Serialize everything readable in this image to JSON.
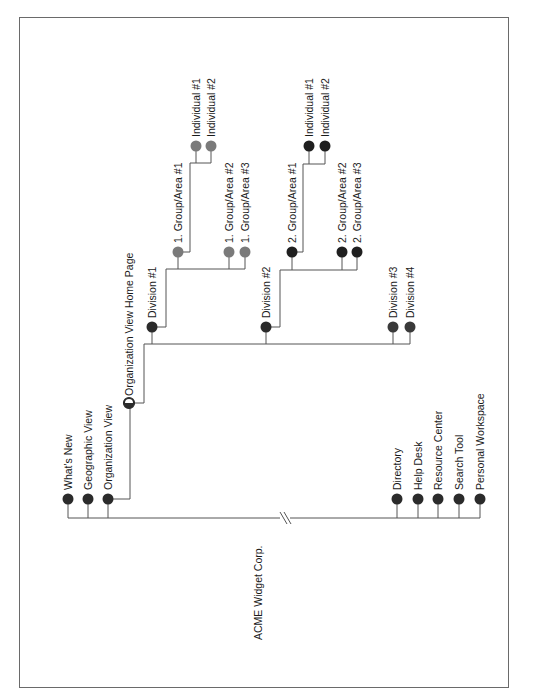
{
  "diagram": {
    "title": "ACME Widget Corp.",
    "colors": {
      "dark_node": "#2b2b2b",
      "gray_node": "#7a7a7a",
      "line": "#555555",
      "border": "#6a6a6a"
    },
    "root_items_left": [
      {
        "label": "What's New",
        "x": 68
      },
      {
        "label": "Geographic View",
        "x": 88
      },
      {
        "label": "Organization View",
        "x": 108
      }
    ],
    "root_items_right": [
      {
        "label": "Directory",
        "x": 397
      },
      {
        "label": "Help Desk",
        "x": 418
      },
      {
        "label": "Resource Center",
        "x": 438
      },
      {
        "label": "Search Tool",
        "x": 459
      },
      {
        "label": "Personal Workspace",
        "x": 480
      }
    ],
    "org_home": {
      "label": "Organization View Home Page"
    },
    "divisions": [
      {
        "label": "Division #1"
      },
      {
        "label": "Division #2"
      },
      {
        "label": "Division #3"
      },
      {
        "label": "Division #4"
      }
    ],
    "division1_groups": [
      {
        "label": "1. Group/Area #1"
      },
      {
        "label": "1. Group/Area #2"
      },
      {
        "label": "1. Group/Area #3"
      }
    ],
    "division1_individuals": [
      {
        "label": "Individual #1"
      },
      {
        "label": "Individual #2"
      }
    ],
    "division2_groups": [
      {
        "label": "2. Group/Area #1"
      },
      {
        "label": "2. Group/Area #2"
      },
      {
        "label": "2. Group/Area #3"
      }
    ],
    "division2_individuals": [
      {
        "label": "Individual #1"
      },
      {
        "label": "Individual #2"
      }
    ],
    "break_symbol": "//"
  }
}
